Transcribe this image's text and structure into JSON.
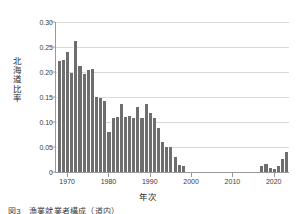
{
  "figure": {
    "caption": "図3　漁業就業者構成（道内）",
    "background": "#ffffff",
    "bar_color": "#6e6e6e",
    "grid_color": "#d9d9d9",
    "axis_color": "#9a9a9a"
  },
  "chart_data": {
    "type": "bar",
    "title": "",
    "xlabel": "年次",
    "ylabel": "北海道比率",
    "xlim": [
      1967.3,
      2023.7
    ],
    "ylim": [
      0,
      0.3
    ],
    "grid": "horizontal",
    "legend": "none",
    "ytick_labels": [
      "0",
      "0.05",
      "0.10",
      "0.15",
      "0.20",
      "0.25",
      "0.30"
    ],
    "ytick_values": [
      0,
      0.05,
      0.1,
      0.15,
      0.2,
      0.25,
      0.3
    ],
    "xtick_labels": [
      "1970",
      "1980",
      "1990",
      "2000",
      "2010",
      "2020"
    ],
    "xtick_values": [
      1970,
      1980,
      1990,
      2000,
      2010,
      2020
    ],
    "x": [
      1968,
      1969,
      1970,
      1971,
      1972,
      1973,
      1974,
      1975,
      1976,
      1977,
      1978,
      1979,
      1980,
      1981,
      1982,
      1983,
      1984,
      1985,
      1986,
      1987,
      1988,
      1989,
      1990,
      1991,
      1992,
      1993,
      1994,
      1995,
      1996,
      1997,
      1998,
      2017,
      2018,
      2019,
      2020,
      2021,
      2022,
      2023
    ],
    "values": [
      0.222,
      0.224,
      0.24,
      0.199,
      0.262,
      0.212,
      0.196,
      0.204,
      0.207,
      0.15,
      0.149,
      0.142,
      0.08,
      0.108,
      0.11,
      0.137,
      0.11,
      0.112,
      0.108,
      0.131,
      0.108,
      0.137,
      0.118,
      0.108,
      0.089,
      0.06,
      0.051,
      0.05,
      0.031,
      0.014,
      0.013,
      0.012,
      0.016,
      0.008,
      0.006,
      0.012,
      0.026,
      0.04
    ]
  }
}
